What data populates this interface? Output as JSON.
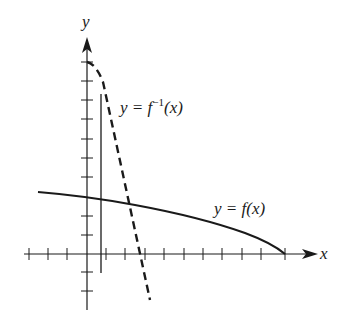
{
  "figure": {
    "axes": {
      "x_label": "x",
      "y_label": "y",
      "origin_px": [
        87,
        254
      ],
      "unit_px": 19.4,
      "x_ticks": [
        -3,
        -2,
        -1,
        1,
        2,
        3,
        4,
        5,
        6,
        7,
        8,
        9,
        10
      ],
      "y_ticks": [
        -3,
        -2,
        -1,
        1,
        2,
        3,
        4,
        5,
        6,
        7,
        8,
        9,
        10
      ]
    },
    "curves": [
      {
        "name": "f",
        "label_prefix": "y = ",
        "label_func": "f",
        "label_sup": "",
        "label_arg": "(x)",
        "style": "solid"
      },
      {
        "name": "f-inverse",
        "label_prefix": "y = ",
        "label_func": "f",
        "label_sup": "−1",
        "label_arg": "(x)",
        "style": "dashed"
      }
    ],
    "vertical_line": {
      "x": 0.7,
      "style": "solid"
    },
    "colors": {
      "ink": "#1a1a1a",
      "background": "#ffffff"
    }
  }
}
